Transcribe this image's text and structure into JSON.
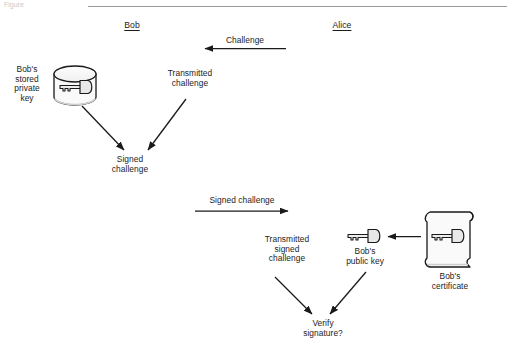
{
  "figure": {
    "caption_stub": "Figure",
    "top_rule": true
  },
  "parties": [
    {
      "id": "bob",
      "label": "Bob"
    },
    {
      "id": "alice",
      "label": "Alice"
    }
  ],
  "labels": {
    "challenge": "Challenge",
    "bobs_stored_private_key": "Bob's\nstored\nprivate\nkey",
    "transmitted_challenge": "Transmitted\nchallenge",
    "signed_challenge_result": "Signed\nchallenge",
    "signed_challenge_transfer": "Signed challenge",
    "transmitted_signed_challenge": "Transmitted\nsigned\nchallenge",
    "bobs_public_key": "Bob's\npublic key",
    "bobs_certificate": "Bob's\ncertificate",
    "verify_signature": "Verify\nsignature?"
  },
  "icons": [
    {
      "name": "database-cylinder-icon",
      "contains": "key-icon"
    },
    {
      "name": "key-icon",
      "label_ref": "bobs_public_key"
    },
    {
      "name": "certificate-scroll-icon",
      "contains": "key-icon",
      "label_ref": "bobs_certificate"
    }
  ],
  "arrows": [
    {
      "name": "challenge-arrow",
      "direction": "left",
      "from": "Alice",
      "to": "Bob",
      "label_ref": "challenge"
    },
    {
      "name": "private-key-to-signed-challenge-arrow",
      "direction": "down-right"
    },
    {
      "name": "transmitted-challenge-to-signed-challenge-arrow",
      "direction": "down-left"
    },
    {
      "name": "signed-challenge-transfer-arrow",
      "direction": "right",
      "from": "Bob",
      "to": "Alice",
      "label_ref": "signed_challenge_transfer"
    },
    {
      "name": "certificate-to-public-key-arrow",
      "direction": "left"
    },
    {
      "name": "transmitted-signed-challenge-to-verify-arrow",
      "direction": "down-right"
    },
    {
      "name": "public-key-to-verify-arrow",
      "direction": "down-left"
    }
  ],
  "colors": {
    "stroke": "#1a1a1a",
    "text": "#1c1c1c",
    "rule": "#9a9a9a",
    "icon_fill": "#f2f2f2",
    "icon_shadow": "#d0d0d0",
    "background": "#ffffff"
  }
}
